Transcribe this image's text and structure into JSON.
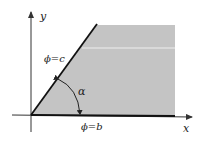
{
  "diagram": {
    "axes": {
      "x_label": "x",
      "y_label": "y"
    },
    "boundaries": [
      {
        "label": "ϕ=c",
        "description": "slanted boundary line"
      },
      {
        "label": "ϕ=b",
        "description": "boundary along x-axis"
      }
    ],
    "angle_label": "α",
    "colors": {
      "region": "#c4c4c4",
      "line": "#111111",
      "axis": "#333333"
    }
  }
}
